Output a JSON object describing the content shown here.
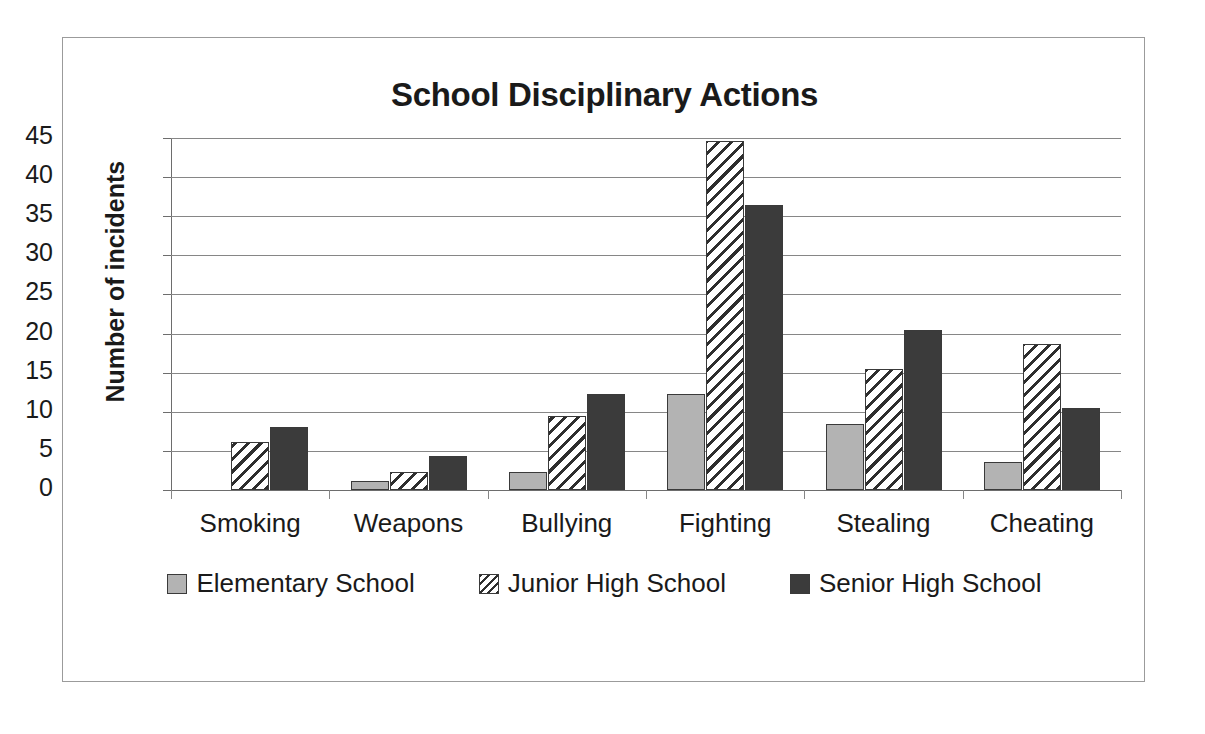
{
  "chart_data": {
    "type": "bar",
    "title": "School Disciplinary Actions",
    "xlabel": "",
    "ylabel": "Number of incidents",
    "categories": [
      "Smoking",
      "Weapons",
      "Bullying",
      "Fighting",
      "Stealing",
      "Cheating"
    ],
    "series": [
      {
        "name": "Elementary School",
        "values": [
          0,
          1.2,
          2.3,
          12.3,
          8.4,
          3.6
        ]
      },
      {
        "name": "Junior High School",
        "values": [
          6.2,
          2.3,
          9.4,
          44.6,
          15.5,
          18.7
        ]
      },
      {
        "name": "Senior High School",
        "values": [
          8.1,
          4.3,
          12.3,
          36.4,
          20.5,
          10.5
        ]
      }
    ],
    "ylim": [
      0,
      45
    ],
    "ytick_labels": [
      "45",
      "40",
      "35",
      "30",
      "25",
      "20",
      "15",
      "10",
      "5",
      "0"
    ],
    "ytick_values": [
      45,
      40,
      35,
      30,
      25,
      20,
      15,
      10,
      5,
      0
    ],
    "grid": true,
    "legend_position": "bottom",
    "colors": {
      "elementary": "#b3b3b3",
      "junior_high": "#ffffff",
      "senior_high": "#3b3b3b",
      "outline": "#3a3a3a",
      "gridline": "#868686",
      "text": "#1a1a1a",
      "frame_border": "#9b9b9b",
      "background": "#ffffff"
    }
  },
  "legend": {
    "items": [
      {
        "label": "Elementary School",
        "swatch": "solid-light-gray-square-icon"
      },
      {
        "label": "Junior High School",
        "swatch": "diagonal-hatch-square-icon"
      },
      {
        "label": "Senior High School",
        "swatch": "solid-dark-gray-square-icon"
      }
    ]
  }
}
